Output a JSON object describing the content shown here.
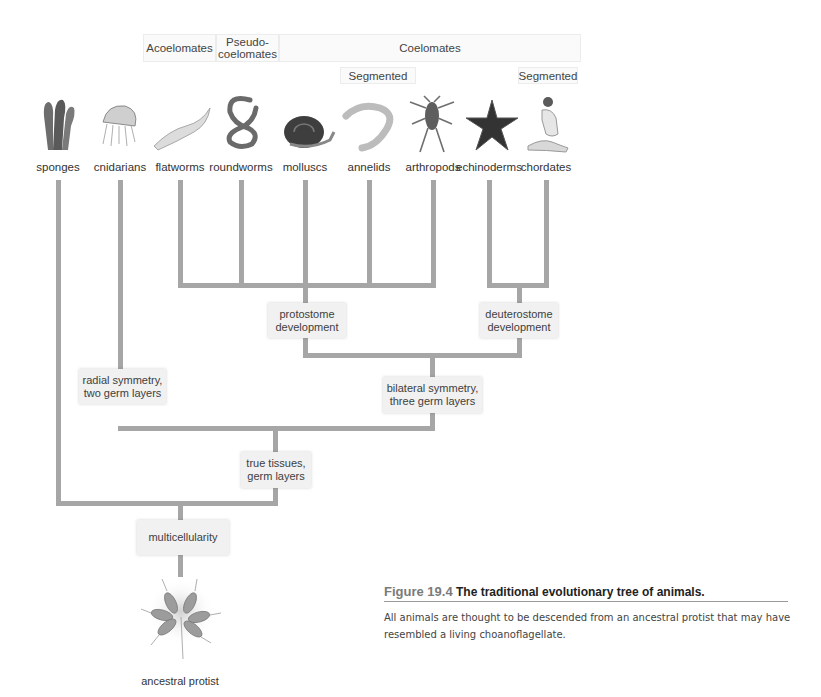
{
  "headers": {
    "acoelomates": "Acoelomates",
    "pseudocoelomates": "Pseudo-\ncoelomates",
    "coelomates": "Coelomates",
    "segmented_1": "Segmented",
    "segmented_2": "Segmented"
  },
  "taxa": [
    {
      "name": "sponges",
      "icon": "sponge-icon"
    },
    {
      "name": "cnidarians",
      "icon": "jellyfish-icon"
    },
    {
      "name": "flatworms",
      "icon": "flatworm-icon"
    },
    {
      "name": "roundworms",
      "icon": "roundworm-icon"
    },
    {
      "name": "molluscs",
      "icon": "snail-icon"
    },
    {
      "name": "annelids",
      "icon": "earthworm-icon"
    },
    {
      "name": "arthropods",
      "icon": "crustacean-icon"
    },
    {
      "name": "echinoderms",
      "icon": "starfish-icon"
    },
    {
      "name": "chordates",
      "icon": "human-icon"
    }
  ],
  "nodes": {
    "protostome": "protostome\ndevelopment",
    "deuterostome": "deuterostome\ndevelopment",
    "radial": "radial symmetry,\ntwo germ layers",
    "bilateral": "bilateral symmetry,\nthree germ layers",
    "true_tissues": "true tissues,\ngerm layers",
    "multicellularity": "multicellularity"
  },
  "root": {
    "label": "ancestral protist",
    "icon": "choanoflagellate-colony-icon"
  },
  "caption": {
    "figure_label": "Figure 19.4",
    "title": "The traditional evolutionary tree of animals.",
    "body": "All animals are thought to be descended from an ancestral protist that may have resembled a living choanoflagellate."
  },
  "colors": {
    "branch": "#a6a6a6",
    "node_bg": "#f1f1f1",
    "header_bg": "#fafafa"
  }
}
